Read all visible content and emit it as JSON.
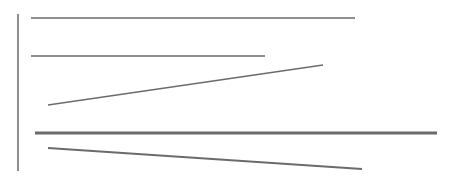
{
  "canvas": {
    "width": 452,
    "height": 177,
    "background": "#ffffff"
  },
  "colors": {
    "stroke": "#6b6b6b"
  },
  "lines": [
    {
      "id": "vertical-axis",
      "x1": 18,
      "y1": 14,
      "x2": 18,
      "y2": 171,
      "width": 1.5
    },
    {
      "id": "line-1",
      "x1": 31,
      "y1": 18,
      "x2": 355,
      "y2": 18,
      "width": 1.6
    },
    {
      "id": "line-2",
      "x1": 31,
      "y1": 56,
      "x2": 265,
      "y2": 56,
      "width": 1.6
    },
    {
      "id": "line-3",
      "x1": 48,
      "y1": 105,
      "x2": 323,
      "y2": 65,
      "width": 1.3
    },
    {
      "id": "line-4",
      "x1": 35,
      "y1": 133,
      "x2": 437,
      "y2": 133,
      "width": 3.2
    },
    {
      "id": "line-5",
      "x1": 48,
      "y1": 148,
      "x2": 362,
      "y2": 169,
      "width": 2.0
    }
  ]
}
